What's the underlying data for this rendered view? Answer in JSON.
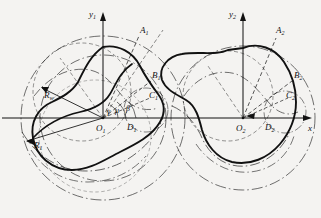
{
  "figure": {
    "kind": "engineering-geometry-diagram",
    "background_color": "#f4f3f1",
    "line_color": "#111111"
  },
  "axes": {
    "x_axis_label": "x",
    "y1_axis_label": "y",
    "y1_axis_sub": "1",
    "y2_axis_label": "y",
    "y2_axis_sub": "2"
  },
  "origins": [
    {
      "name": "O",
      "sub": "1",
      "x": 103,
      "y": 118
    },
    {
      "name": "O",
      "sub": "2",
      "x": 243,
      "y": 118
    }
  ],
  "points": [
    {
      "name": "A",
      "sub": "1",
      "label_x": 140,
      "label_y": 33
    },
    {
      "name": "B",
      "sub": "1",
      "label_x": 152,
      "label_y": 78
    },
    {
      "name": "C",
      "sub": "1",
      "label_x": 150,
      "label_y": 97
    },
    {
      "name": "D",
      "sub": "1",
      "label_x": 130,
      "label_y": 126
    },
    {
      "name": "A",
      "sub": "2",
      "label_x": 276,
      "label_y": 33
    },
    {
      "name": "B",
      "sub": "2",
      "label_x": 295,
      "label_y": 78
    },
    {
      "name": "C",
      "sub": "2",
      "label_x": 287,
      "label_y": 97
    },
    {
      "name": "D",
      "sub": "2",
      "label_x": 268,
      "label_y": 126
    }
  ],
  "radii": [
    {
      "name": "R",
      "sub": "w",
      "label_x": 46,
      "label_y": 96
    },
    {
      "name": "R",
      "sub": "1",
      "label_x": 36,
      "label_y": 145
    }
  ],
  "angles": [
    {
      "symbol": "γ",
      "label_x": 108,
      "label_y": 113
    },
    {
      "symbol": "μ",
      "label_x": 116,
      "label_y": 112
    },
    {
      "symbol": "β",
      "label_x": 127,
      "label_y": 110
    }
  ]
}
